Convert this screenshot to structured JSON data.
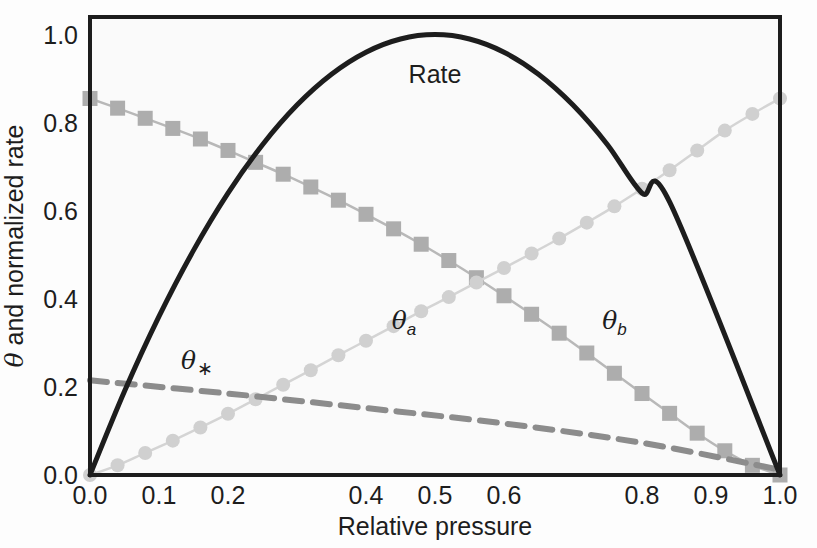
{
  "figure": {
    "background_color": "#fdfdfd",
    "plot_background_color": "#fafafa",
    "frame_color": "#1d1d1d"
  },
  "axes": {
    "xlabel": "Relative pressure",
    "ylabel_prefix": "θ",
    "ylabel_suffix": " and normalized rate",
    "x_ticks": [
      "0.0",
      "0.1",
      "0.2",
      "0.4",
      "0.5",
      "0.6",
      "0.8",
      "0.9",
      "1.0"
    ],
    "y_ticks": [
      "0.0",
      "0.2",
      "0.4",
      "0.6",
      "0.8",
      "1.0"
    ]
  },
  "annotations": {
    "rate": "Rate",
    "theta_a_sym": "θ",
    "theta_a_sub": "a",
    "theta_b_sym": "θ",
    "theta_b_sub": "b",
    "theta_star_sym": "θ",
    "theta_star_sub": "∗"
  },
  "chart_data": {
    "type": "line",
    "title": "",
    "xlabel": "Relative pressure",
    "ylabel": "θ and normalized rate",
    "xlim": [
      0.0,
      1.0
    ],
    "ylim": [
      0.0,
      1.04
    ],
    "grid": false,
    "legend_position": "inline-annotations",
    "x_tick_values": [
      0.0,
      0.1,
      0.2,
      0.4,
      0.5,
      0.6,
      0.8,
      0.9,
      1.0
    ],
    "x_tick_labels": [
      "0.0",
      "0.1",
      "0.2",
      "0.4",
      "0.5",
      "0.6",
      "0.8",
      "0.9",
      "1.0"
    ],
    "y_tick_values": [
      0.0,
      0.2,
      0.4,
      0.6,
      0.8,
      1.0
    ],
    "y_tick_labels": [
      "0.0",
      "0.2",
      "0.4",
      "0.6",
      "0.8",
      "1.0"
    ],
    "series": [
      {
        "name": "Rate",
        "label": "Rate",
        "style": "solid",
        "color": "#1d1d1d",
        "linewidth": 5,
        "marker": "none",
        "x": [
          0.0,
          0.05,
          0.1,
          0.15,
          0.2,
          0.25,
          0.3,
          0.35,
          0.4,
          0.45,
          0.5,
          0.55,
          0.6,
          0.65,
          0.7,
          0.75,
          0.8,
          0.84,
          1.0
        ],
        "values": [
          0.0,
          0.19,
          0.36,
          0.51,
          0.64,
          0.75,
          0.84,
          0.91,
          0.96,
          0.99,
          1.0,
          0.99,
          0.96,
          0.91,
          0.84,
          0.75,
          0.64,
          0.62,
          0.0
        ]
      },
      {
        "name": "theta_b",
        "label": "θb",
        "style": "solid",
        "color": "#b8b8b8",
        "marker": "square",
        "marker_color": "#adadad",
        "x": [
          0.0,
          0.04,
          0.08,
          0.12,
          0.16,
          0.2,
          0.24,
          0.28,
          0.32,
          0.36,
          0.4,
          0.44,
          0.48,
          0.52,
          0.56,
          0.6,
          0.64,
          0.68,
          0.72,
          0.76,
          0.8,
          0.84,
          0.88,
          0.92,
          0.96,
          1.0
        ],
        "values": [
          0.855,
          0.833,
          0.81,
          0.787,
          0.763,
          0.737,
          0.71,
          0.683,
          0.654,
          0.624,
          0.592,
          0.559,
          0.524,
          0.487,
          0.448,
          0.407,
          0.365,
          0.322,
          0.277,
          0.231,
          0.185,
          0.14,
          0.095,
          0.055,
          0.022,
          0.0
        ]
      },
      {
        "name": "theta_a",
        "label": "θa",
        "style": "solid",
        "color": "#d4d4d4",
        "marker": "circle",
        "marker_color": "#d0d0d0",
        "x": [
          0.0,
          0.04,
          0.08,
          0.12,
          0.16,
          0.2,
          0.24,
          0.28,
          0.32,
          0.36,
          0.4,
          0.44,
          0.48,
          0.52,
          0.56,
          0.6,
          0.64,
          0.68,
          0.72,
          0.76,
          0.8,
          0.84,
          0.88,
          0.92,
          0.96,
          1.0
        ],
        "values": [
          0.0,
          0.022,
          0.05,
          0.078,
          0.108,
          0.139,
          0.172,
          0.205,
          0.238,
          0.272,
          0.305,
          0.338,
          0.372,
          0.404,
          0.437,
          0.47,
          0.503,
          0.537,
          0.573,
          0.61,
          0.65,
          0.692,
          0.737,
          0.782,
          0.82,
          0.855
        ]
      },
      {
        "name": "theta_star",
        "label": "θ∗",
        "style": "dashed",
        "color": "#8c8c8c",
        "linewidth": 6,
        "marker": "none",
        "x": [
          0.0,
          0.2,
          0.4,
          0.6,
          0.8,
          1.0
        ],
        "values": [
          0.215,
          0.185,
          0.152,
          0.117,
          0.073,
          0.012
        ]
      }
    ],
    "annotations": [
      {
        "text": "Rate",
        "x": 0.5,
        "y": 0.91
      },
      {
        "text": "θa",
        "x": 0.455,
        "y": 0.345
      },
      {
        "text": "θb",
        "x": 0.76,
        "y": 0.345
      },
      {
        "text": "θ∗",
        "x": 0.155,
        "y": 0.255
      }
    ]
  }
}
